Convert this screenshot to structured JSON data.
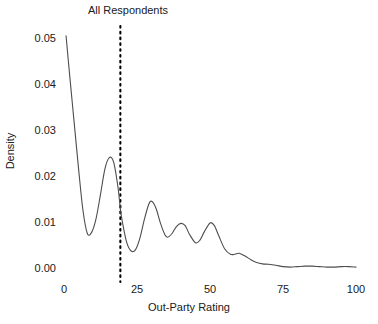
{
  "chart_data": {
    "type": "line",
    "title": "All Respondents",
    "xlabel": "Out-Party Rating",
    "ylabel": "Density",
    "xlim": [
      0,
      100
    ],
    "ylim": [
      0.0,
      0.05
    ],
    "xticks": [
      0,
      25,
      50,
      75,
      100
    ],
    "xtick_labels": [
      "0",
      "25",
      "50",
      "75",
      "100"
    ],
    "yticks": [
      0.0,
      0.01,
      0.02,
      0.03,
      0.04,
      0.05
    ],
    "ytick_labels": [
      "0.00",
      "0.01",
      "0.02",
      "0.03",
      "0.04",
      "0.05"
    ],
    "grid": false,
    "legend": false,
    "line_color": "#4d4d4d",
    "annotations": [
      {
        "name": "mean-reference-line",
        "type": "vline",
        "x": 19.3,
        "style": "dotted",
        "color": "#000000"
      }
    ],
    "series": [
      {
        "name": "Density of Out-Party Rating",
        "x": [
          0.7,
          2,
          3.5,
          5,
          6.5,
          8,
          9.5,
          11,
          12.5,
          14,
          15.5,
          17,
          18.5,
          19.3,
          20,
          21.5,
          23,
          24.5,
          26,
          27.5,
          29,
          30,
          31.5,
          33,
          34.5,
          35.5,
          37,
          38.5,
          40,
          41.5,
          43,
          45,
          46.5,
          48,
          50,
          51.5,
          53,
          55,
          57,
          58.5,
          60,
          62,
          64,
          66,
          68,
          70,
          72.5,
          75,
          77.5,
          80,
          82.5,
          85,
          87.5,
          90,
          92.5,
          95,
          97.5,
          100
        ],
        "y": [
          0.0505,
          0.0415,
          0.0315,
          0.0215,
          0.0125,
          0.0075,
          0.0078,
          0.0108,
          0.016,
          0.0215,
          0.024,
          0.023,
          0.0175,
          0.0128,
          0.01,
          0.0055,
          0.0037,
          0.004,
          0.0065,
          0.0105,
          0.0138,
          0.0145,
          0.013,
          0.0098,
          0.0073,
          0.0067,
          0.0075,
          0.009,
          0.0097,
          0.0092,
          0.0073,
          0.0055,
          0.006,
          0.0078,
          0.0098,
          0.0092,
          0.007,
          0.0042,
          0.003,
          0.003,
          0.0032,
          0.0026,
          0.0018,
          0.0012,
          0.0009,
          0.0008,
          0.0006,
          0.0003,
          0.0002,
          0.0003,
          0.0004,
          0.0004,
          0.0003,
          0.0002,
          0.0002,
          0.0003,
          0.0003,
          0.0002
        ]
      }
    ]
  },
  "axes": {
    "title": "All Respondents",
    "xlabel": "Out-Party Rating",
    "ylabel": "Density"
  }
}
